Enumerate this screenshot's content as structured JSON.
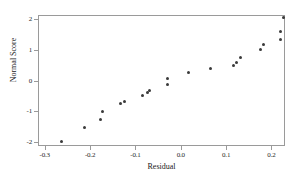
{
  "chart_data": {
    "type": "scatter",
    "title": "",
    "xlabel": "Residual",
    "ylabel": "Normal Score",
    "xlim": [
      -0.3149,
      0.2299
    ],
    "ylim": [
      -2.1137,
      2.1137
    ],
    "grid": false,
    "legend": null,
    "xticks": [
      -0.3,
      -0.2,
      -0.1,
      0.0,
      0.1,
      0.2
    ],
    "xticklabels": [
      "-0.3",
      "-0.2",
      "-0.1",
      "0.0",
      "0.1",
      "0.2"
    ],
    "yticks": [
      -2,
      -1,
      0,
      1,
      2
    ],
    "yticklabels": [
      "-2",
      "-1",
      "0",
      "1",
      "2"
    ],
    "marker": "filled-circle",
    "marker_color": "#3a3a3a",
    "points": [
      {
        "x": -0.2634,
        "y": -1.97
      },
      {
        "x": -0.212,
        "y": -1.52
      },
      {
        "x": -0.1777,
        "y": -1.26
      },
      {
        "x": -0.1734,
        "y": -1.01
      },
      {
        "x": -0.1328,
        "y": -0.75
      },
      {
        "x": -0.1242,
        "y": -0.69
      },
      {
        "x": -0.0835,
        "y": -0.5
      },
      {
        "x": -0.0728,
        "y": -0.38
      },
      {
        "x": -0.0685,
        "y": -0.31
      },
      {
        "x": -0.03,
        "y": 0.06
      },
      {
        "x": -0.03,
        "y": -0.12
      },
      {
        "x": 0.0171,
        "y": 0.25
      },
      {
        "x": 0.0663,
        "y": 0.38
      },
      {
        "x": 0.1155,
        "y": 0.47
      },
      {
        "x": 0.124,
        "y": 0.57
      },
      {
        "x": 0.1326,
        "y": 0.75
      },
      {
        "x": 0.1754,
        "y": 1.01
      },
      {
        "x": 0.1818,
        "y": 1.17
      },
      {
        "x": 0.2203,
        "y": 1.33
      },
      {
        "x": 0.2203,
        "y": 1.58
      },
      {
        "x": 0.2267,
        "y": 2.03
      }
    ]
  },
  "axes": {
    "x_label": "Residual",
    "y_label": "Normal Score"
  }
}
